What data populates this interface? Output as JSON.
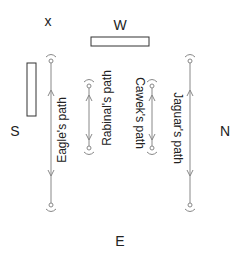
{
  "labels": {
    "x": "x",
    "west": "W",
    "south": "S",
    "north": "N",
    "east": "E"
  },
  "paths": [
    {
      "name": "Eagle's path",
      "direction": "down"
    },
    {
      "name": "Rabinal's path",
      "direction": "bidirectional"
    },
    {
      "name": "Cawek's path",
      "direction": "bidirectional"
    },
    {
      "name": "Jaguar's path",
      "direction": "up"
    }
  ],
  "colors": {
    "line": "#888888",
    "text": "#222222",
    "outline": "#333333"
  }
}
